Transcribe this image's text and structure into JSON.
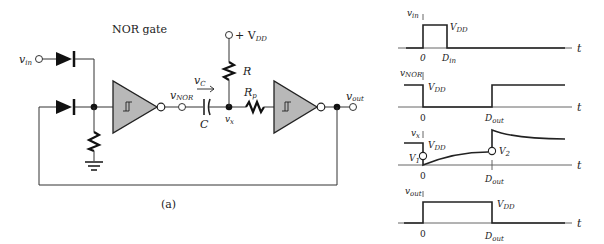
{
  "circuit": {
    "title": "NOR gate",
    "caption": "(a)",
    "labels": {
      "vin": "v",
      "vin_sub": "in",
      "vnor": "v",
      "vnor_sub": "NOR",
      "vc": "v",
      "vc_sub": "C",
      "cap": "C",
      "vx": "v",
      "vx_sub": "x",
      "r": "R",
      "rp": "R",
      "rp_sub": "p",
      "vdd": "+ V",
      "vdd_sub": "DD",
      "vout": "v",
      "vout_sub": "out"
    },
    "components": [
      "diode-input",
      "diode-feedback",
      "pulldown-resistor",
      "ground",
      "schmitt-inverter-1",
      "capacitor-C",
      "resistor-R",
      "resistor-Rp",
      "schmitt-inverter-2"
    ]
  },
  "waveforms": [
    {
      "signal": "v",
      "signal_sub": "in",
      "level_label": "V",
      "level_sub": "DD",
      "ticks": [
        "0",
        "D"
      ],
      "tick_subs": [
        "",
        "in"
      ],
      "axis_label": "t"
    },
    {
      "signal": "v",
      "signal_sub": "NOR",
      "level_label": "V",
      "level_sub": "DD",
      "ticks": [
        "0",
        "D"
      ],
      "tick_subs": [
        "",
        "out"
      ],
      "axis_label": "t"
    },
    {
      "signal": "v",
      "signal_sub": "x",
      "level_label": "V",
      "level_sub": "DD",
      "v1": "V",
      "v1_sub": "1",
      "v2": "V",
      "v2_sub": "2",
      "ticks": [
        "0",
        "D"
      ],
      "tick_subs": [
        "",
        "out"
      ],
      "axis_label": "t"
    },
    {
      "signal": "v",
      "signal_sub": "out",
      "level_label": "V",
      "level_sub": "DD",
      "ticks": [
        "0",
        "D"
      ],
      "tick_subs": [
        "",
        "out"
      ],
      "axis_label": "t"
    }
  ],
  "colors": {
    "gate_fill": "#b8b8b8",
    "line": "#222222",
    "background": "#ffffff"
  }
}
